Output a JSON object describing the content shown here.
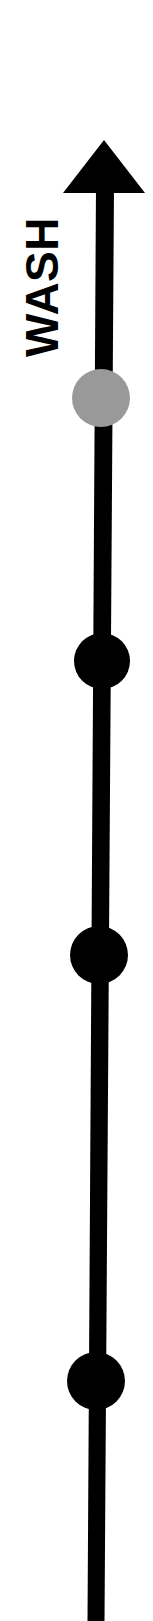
{
  "figure": {
    "background_color": "#ffffff"
  },
  "axis": {
    "label": "WASH",
    "label_color": "#000000",
    "label_rotation_deg": -90,
    "label_font_size_px": 46,
    "direction": "upward",
    "line_color": "#000000",
    "line_width_px": 17,
    "arrowhead": {
      "name": "arrow-up-head",
      "color": "#000000",
      "tip_x": 104,
      "tip_y": 140,
      "base_y": 193,
      "half_width_px": 41
    },
    "top_x": 105,
    "top_y": 190,
    "bottom_x": 96,
    "bottom_y": 1621
  },
  "nodes": [
    {
      "name": "node-gray",
      "label": "",
      "fill": "#999999",
      "stroke": "none",
      "cx": 101,
      "cy": 398,
      "r": 29
    },
    {
      "name": "node-black-1",
      "label": "",
      "fill": "#000000",
      "stroke": "none",
      "cx": 102,
      "cy": 661,
      "r": 28
    },
    {
      "name": "node-black-2",
      "label": "",
      "fill": "#000000",
      "stroke": "none",
      "cx": 99,
      "cy": 955,
      "r": 29
    },
    {
      "name": "node-black-3",
      "label": "",
      "fill": "#000000",
      "stroke": "none",
      "cx": 96,
      "cy": 1381,
      "r": 29
    }
  ],
  "chart_data": {
    "type": "diagram",
    "title": "WASH",
    "xlabel": "",
    "ylabel": "WASH",
    "grid": false,
    "legend": "none",
    "axis_direction": "up",
    "categories": [
      "node-gray",
      "node-black-1",
      "node-black-2",
      "node-black-3"
    ],
    "values": [
      398,
      661,
      955,
      1381
    ],
    "colors": [
      "#999999",
      "#000000",
      "#000000",
      "#000000"
    ]
  }
}
